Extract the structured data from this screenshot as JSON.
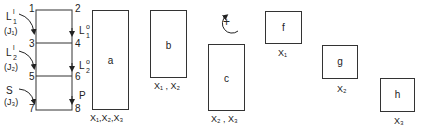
{
  "column": {
    "node_numbers": [
      "1",
      "2",
      "3",
      "4",
      "5",
      "6",
      "7",
      "8"
    ],
    "left_labels": [
      {
        "name": "L",
        "sup": "l",
        "sub": "1",
        "flux": "(J₁)"
      },
      {
        "name": "L",
        "sup": "l",
        "sub": "2",
        "flux": "(J₂)"
      },
      {
        "name": "S",
        "flux": "(J₃)"
      }
    ],
    "right_labels": [
      {
        "name": "L",
        "sup": "o",
        "sub": "1"
      },
      {
        "name": "L",
        "sup": "o",
        "sub": "2"
      },
      {
        "name": "P"
      }
    ]
  },
  "blocks": [
    {
      "id": "a",
      "label": "a",
      "variables": "X₁,X₂,X₃"
    },
    {
      "id": "b",
      "label": "b",
      "variables": "X₁ , X₂"
    },
    {
      "id": "c",
      "label": "c",
      "variables": "X₂ , X₃"
    },
    {
      "id": "f",
      "label": "f",
      "variables": "X₁"
    },
    {
      "id": "g",
      "label": "g",
      "variables": "X₂"
    },
    {
      "id": "h",
      "label": "h",
      "variables": "X₃"
    }
  ],
  "operator": {
    "symbol": "+"
  }
}
